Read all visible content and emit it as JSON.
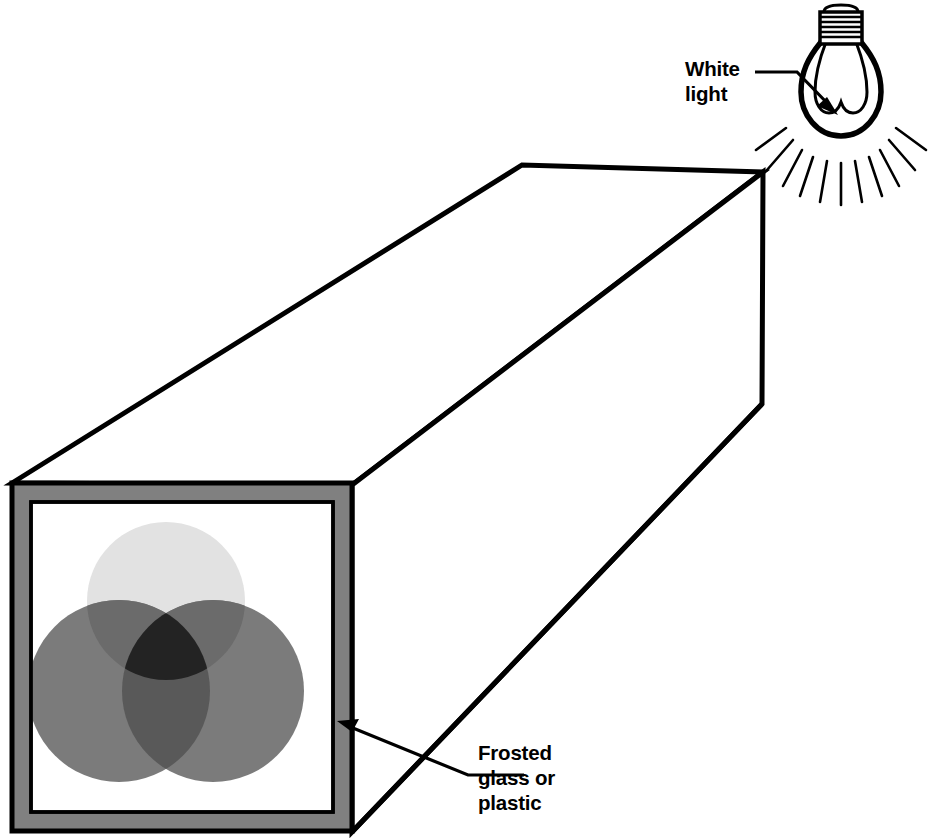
{
  "figure": {
    "kind": "light-mixing-box-diagram",
    "background_color": "#ffffff",
    "line_color": "#000000"
  },
  "labels": {
    "white_light": "White\nlight",
    "frosted_glass": "Frosted\nglass or\nplastic"
  },
  "light_source": {
    "name": "incandescent-light-bulb",
    "label_text": "White\nlight",
    "glass_outline_color": "#000000",
    "base_type": "screw-thread",
    "thread_line_count": 7,
    "filament_loops": 3,
    "ray_count": 11,
    "bulb_center_x": 841,
    "bulb_center_y": 97,
    "glass_radius": 39
  },
  "box": {
    "name": "rectangular-light-box",
    "face_outline_color": "#000000",
    "frame_color": "#808080",
    "panel_color": "#ffffff",
    "front_face": {
      "outer_left": 12,
      "outer_top": 483,
      "outer_right": 352,
      "outer_bottom": 831,
      "frame_thickness": 19
    },
    "far_end": {
      "top_left_x": 522,
      "top_left_y": 165,
      "top_right_x": 763,
      "top_right_y": 172,
      "bottom_right_x": 762,
      "bottom_right_y": 404
    }
  },
  "color_circles": {
    "description": "three overlapping translucent light patches on the frosted panel",
    "count": 3,
    "items": [
      {
        "name": "top-circle",
        "cx": 166,
        "cy": 601,
        "r": 79,
        "fill": "#e2e2e2"
      },
      {
        "name": "bottom-left-circle",
        "cx": 119,
        "cy": 691,
        "r": 91,
        "fill": "#7b7b7b"
      },
      {
        "name": "bottom-right-circle",
        "cx": 213,
        "cy": 691,
        "r": 91,
        "fill": "#7b7b7b"
      }
    ],
    "overlaps": [
      {
        "name": "top-and-bottom-left-overlap",
        "fill": "#6b6b6b"
      },
      {
        "name": "top-and-bottom-right-overlap",
        "fill": "#6b6b6b"
      },
      {
        "name": "bottom-left-and-bottom-right-overlap",
        "fill": "#595959"
      },
      {
        "name": "all-three-overlap",
        "fill": "#232323"
      }
    ]
  },
  "leader_lines": [
    {
      "name": "white-light-leader",
      "points": "755,72 797,72 836,112",
      "arrow_at": "836,112"
    },
    {
      "name": "frosted-glass-leader",
      "points": "524,773 466,773 339,722",
      "arrow_at": "339,722"
    }
  ]
}
